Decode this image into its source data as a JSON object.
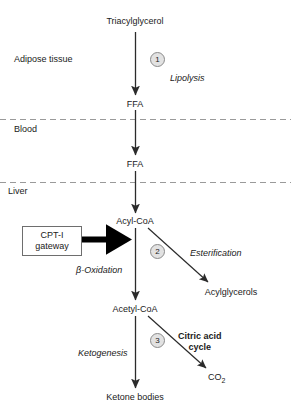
{
  "diagram": {
    "title_node": "Triacylglycerol",
    "compartments": [
      {
        "label": "Adipose tissue"
      },
      {
        "label": "Blood"
      },
      {
        "label": "Liver"
      }
    ],
    "nodes": [
      {
        "id": "tag",
        "label": "Triacylglycerol"
      },
      {
        "id": "ffa1",
        "label": "FFA"
      },
      {
        "id": "ffa2",
        "label": "FFA"
      },
      {
        "id": "acylcoa",
        "label": "Acyl-CoA"
      },
      {
        "id": "acetylcoa",
        "label": "Acetyl-CoA"
      },
      {
        "id": "ketones",
        "label": "Ketone bodies"
      },
      {
        "id": "acylglycerols",
        "label": "Acylglycerols"
      },
      {
        "id": "co2",
        "label": "CO",
        "subscript": "2"
      }
    ],
    "steps": [
      {
        "number": "1",
        "process": "Lipolysis",
        "style": "italic"
      },
      {
        "number": "2",
        "process": "β-Oxidation",
        "style": "italic"
      },
      {
        "number": "3",
        "process": "Ketogenesis",
        "style": "italic"
      }
    ],
    "branch_labels": [
      {
        "label": "Esterification",
        "style": "italic"
      },
      {
        "label": "Citric acid",
        "label2": "cycle",
        "style": "bold"
      }
    ],
    "gateway": {
      "line1": "CPT-I",
      "line2": "gateway"
    },
    "colors": {
      "arrow": "#2b2b2b",
      "thick_arrow": "#000000",
      "dashed_line": "#9a9a9a",
      "circle_fill": "#e2e2e2",
      "circle_stroke": "#8a8a8a",
      "text": "#1a1a1a",
      "box_border": "#6e6e6e"
    }
  }
}
